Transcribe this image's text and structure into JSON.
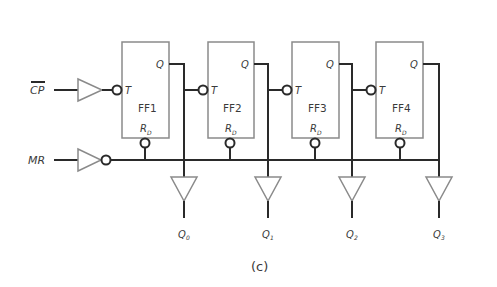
{
  "diagram": {
    "type": "asynchronous-binary-counter",
    "caption": "(c)",
    "inputs": {
      "clock": {
        "label": "CP",
        "overline": true
      },
      "reset": {
        "label": "MR"
      }
    },
    "flip_flops": [
      {
        "name": "FF1",
        "clock_pin": "T",
        "output_pin": "Q",
        "reset_pin": "R",
        "reset_sub": "D"
      },
      {
        "name": "FF2",
        "clock_pin": "T",
        "output_pin": "Q",
        "reset_pin": "R",
        "reset_sub": "D"
      },
      {
        "name": "FF3",
        "clock_pin": "T",
        "output_pin": "Q",
        "reset_pin": "R",
        "reset_sub": "D"
      },
      {
        "name": "FF4",
        "clock_pin": "T",
        "output_pin": "Q",
        "reset_pin": "R",
        "reset_sub": "D"
      }
    ],
    "outputs": [
      {
        "label": "Q",
        "sub": "0"
      },
      {
        "label": "Q",
        "sub": "1"
      },
      {
        "label": "Q",
        "sub": "2"
      },
      {
        "label": "Q",
        "sub": "3"
      }
    ]
  }
}
